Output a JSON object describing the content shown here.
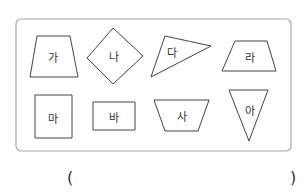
{
  "figure": {
    "frame": {
      "x": 16,
      "y": 19,
      "width": 275,
      "height": 132,
      "radius": 5,
      "stroke": "#a8a8a8"
    },
    "shape_stroke": "#444444",
    "label_color": "#333333",
    "shapes": [
      {
        "label": "가",
        "kind": "trapezoid",
        "points": "37,36 70,36 78,77 30,77",
        "label_x": 53,
        "label_y": 59
      },
      {
        "label": "나",
        "kind": "rhombus",
        "points": "113,28 143,56 113,84 87,58",
        "label_x": 114,
        "label_y": 58
      },
      {
        "label": "다",
        "kind": "triangle",
        "points": "165,36 211,46 151,77",
        "label_x": 172,
        "label_y": 54
      },
      {
        "label": "라",
        "kind": "trapezoid",
        "points": "235,41 267,41 276,71 222,71",
        "label_x": 250,
        "label_y": 59
      },
      {
        "label": "마",
        "kind": "rectangle",
        "points": "35,95 72,95 72,138 35,138",
        "label_x": 53,
        "label_y": 120
      },
      {
        "label": "바",
        "kind": "rectangle",
        "points": "93,102 135,102 135,130 93,130",
        "label_x": 114,
        "label_y": 119
      },
      {
        "label": "사",
        "kind": "trapezoid",
        "points": "154,100 209,100 198,131 165,131",
        "label_x": 182,
        "label_y": 118
      },
      {
        "label": "아",
        "kind": "triangle",
        "points": "229,90 268,90 249,141",
        "label_x": 250,
        "label_y": 112
      }
    ]
  },
  "answer": {
    "open_paren": "(",
    "close_paren": ")",
    "value": ""
  }
}
